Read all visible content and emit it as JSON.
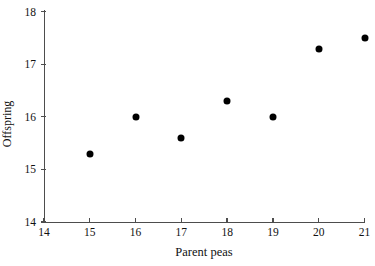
{
  "chart_data": {
    "type": "scatter",
    "title": "",
    "xlabel": "Parent peas",
    "ylabel": "Offspring",
    "xlim": [
      14,
      21
    ],
    "ylim": [
      14,
      18
    ],
    "xticks": [
      "14",
      "15",
      "16",
      "17",
      "18",
      "19",
      "20",
      "21"
    ],
    "yticks": [
      "14",
      "15",
      "16",
      "17",
      "18"
    ],
    "grid": false,
    "legend": null,
    "marker": "filled-circle",
    "marker_color": "#000000",
    "x": [
      15,
      16,
      17,
      18,
      19,
      20,
      21
    ],
    "y": [
      15.3,
      16.0,
      15.6,
      16.3,
      16.0,
      17.3,
      17.5
    ],
    "points": [
      {
        "x": 15,
        "y": 15.3
      },
      {
        "x": 16,
        "y": 16.0
      },
      {
        "x": 17,
        "y": 15.6
      },
      {
        "x": 18,
        "y": 16.3
      },
      {
        "x": 19,
        "y": 16.0
      },
      {
        "x": 20,
        "y": 17.3
      },
      {
        "x": 21,
        "y": 17.5
      }
    ]
  },
  "axes": {
    "x_tick_labels": [
      "14",
      "15",
      "16",
      "17",
      "18",
      "19",
      "20",
      "21"
    ],
    "y_tick_labels": [
      "14",
      "15",
      "16",
      "17",
      "18"
    ],
    "x_axis_title": "Parent peas",
    "y_axis_title": "Offspring",
    "axis_color": "#4d4d4d"
  }
}
